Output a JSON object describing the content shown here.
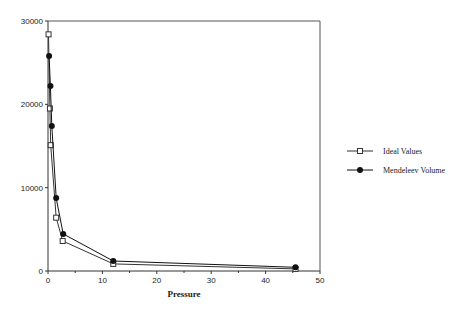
{
  "chart_data": {
    "type": "line",
    "title": "",
    "xlabel": "Pressure",
    "ylabel": "",
    "xlim": [
      0,
      50
    ],
    "ylim": [
      0,
      30000
    ],
    "xticks": [
      0,
      10,
      20,
      30,
      40,
      50
    ],
    "yticks": [
      0,
      10000,
      20000,
      30000
    ],
    "grid": false,
    "legend_position": "right",
    "series": [
      {
        "name": "Ideal Values",
        "marker": "open-square",
        "color": "#333333",
        "points": [
          {
            "x": 0.1,
            "y": 28400
          },
          {
            "x": 0.35,
            "y": 19500
          },
          {
            "x": 0.5,
            "y": 15100
          },
          {
            "x": 1.5,
            "y": 6400
          },
          {
            "x": 2.7,
            "y": 3600
          },
          {
            "x": 12,
            "y": 850
          },
          {
            "x": 45.5,
            "y": 250
          }
        ]
      },
      {
        "name": "Mendeleev Volume",
        "marker": "filled-circle",
        "color": "#111111",
        "points": [
          {
            "x": 0.2,
            "y": 25800
          },
          {
            "x": 0.45,
            "y": 22200
          },
          {
            "x": 0.7,
            "y": 17400
          },
          {
            "x": 1.5,
            "y": 8750
          },
          {
            "x": 2.8,
            "y": 4450
          },
          {
            "x": 12,
            "y": 1200
          },
          {
            "x": 45.5,
            "y": 450
          }
        ]
      }
    ]
  },
  "legend": {
    "items": [
      {
        "label": "Ideal Values"
      },
      {
        "label": "Mendeleev Volume"
      }
    ]
  },
  "axes": {
    "x_title": "Pressure",
    "x_tick_labels": [
      "0",
      "10",
      "20",
      "30",
      "40",
      "50"
    ],
    "y_tick_labels": [
      "0",
      "10000",
      "20000",
      "30000"
    ]
  }
}
